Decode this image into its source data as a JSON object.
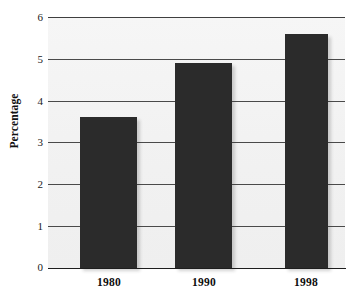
{
  "chart_data": {
    "type": "bar",
    "title": "",
    "subtitle": "",
    "xlabel": "",
    "ylabel": "Percentage",
    "categories": [
      "1980",
      "1990",
      "1998"
    ],
    "values": [
      3.6,
      4.9,
      5.6
    ],
    "series": [
      {
        "name": "Percentage",
        "values": [
          3.6,
          4.9,
          5.6
        ]
      }
    ],
    "ylim": [
      0,
      6
    ],
    "ytick_labels": [
      "0",
      "1",
      "2",
      "3",
      "4",
      "5",
      "6"
    ],
    "ytick_values": [
      0,
      1,
      2,
      3,
      4,
      5,
      6
    ],
    "grid": true,
    "grid_axis": "y",
    "legend": false,
    "legend_position": "none",
    "bar_color": "#2b2b2b",
    "plot_background": "#f2f2f2",
    "axis_color": "#1e1e1e",
    "grid_color": "#4a4a4a"
  },
  "axes": {
    "y_title": "Percentage",
    "y_labels": {
      "t0": "0",
      "t1": "1",
      "t2": "2",
      "t3": "3",
      "t4": "4",
      "t5": "5",
      "t6": "6"
    },
    "x_labels": {
      "c0": "1980",
      "c1": "1990",
      "c2": "1998"
    }
  }
}
